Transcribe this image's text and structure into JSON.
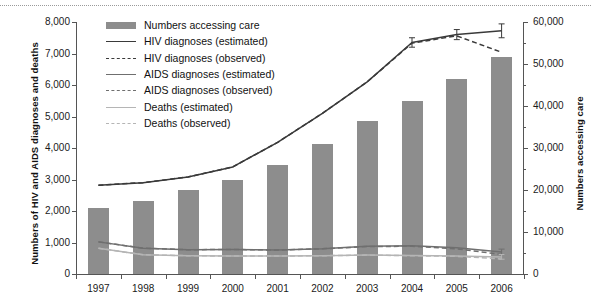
{
  "chart_data": {
    "type": "bar",
    "title": "",
    "subtitle": "",
    "categories": [
      "1997",
      "1998",
      "1999",
      "2000",
      "2001",
      "2002",
      "2003",
      "2004",
      "2005",
      "2006"
    ],
    "xlabel": "",
    "ylabel": "Numbers of HIV and AIDS diagnoses and deaths",
    "y2label": "Numbers accessing care",
    "ylim": [
      0,
      8000
    ],
    "y2lim": [
      0,
      60000
    ],
    "yticks": [
      "0",
      "1,000",
      "2,000",
      "3,000",
      "4,000",
      "5,000",
      "6,000",
      "7,000",
      "8,000"
    ],
    "ytick_values": [
      0,
      1000,
      2000,
      3000,
      4000,
      5000,
      6000,
      7000,
      8000
    ],
    "y2ticks": [
      "0",
      "10,000",
      "20,000",
      "30,000",
      "40,000",
      "50,000",
      "60,000"
    ],
    "y2tick_values": [
      0,
      10000,
      20000,
      30000,
      40000,
      50000,
      60000
    ],
    "grid": false,
    "legend_position": "top-left",
    "series": [
      {
        "name": "Numbers accessing care",
        "kind": "bar",
        "axis": "right",
        "color": "#8d8d8d",
        "values": [
          15700,
          17400,
          19900,
          22300,
          26000,
          31000,
          36400,
          41100,
          46500,
          51600
        ]
      },
      {
        "name": "HIV diagnoses (estimated)",
        "kind": "line",
        "style": "solid",
        "axis": "left",
        "color": "#3a3a3a",
        "values": [
          2820,
          2900,
          3080,
          3400,
          4180,
          5100,
          6100,
          7350,
          7600,
          7720
        ],
        "error_bars": [
          {
            "category": "2004",
            "value": 7350,
            "low": 7200,
            "high": 7500
          },
          {
            "category": "2005",
            "value": 7600,
            "low": 7440,
            "high": 7760
          },
          {
            "category": "2006",
            "value": 7720,
            "low": 7500,
            "high": 7940
          }
        ]
      },
      {
        "name": "HIV diagnoses (observed)",
        "kind": "line",
        "style": "dashed",
        "axis": "left",
        "color": "#3a3a3a",
        "values": [
          2820,
          2900,
          3080,
          3400,
          4180,
          5100,
          6100,
          7330,
          7560,
          7040
        ]
      },
      {
        "name": "AIDS diagnoses (estimated)",
        "kind": "line",
        "style": "solid",
        "axis": "left",
        "color": "#6f6f6f",
        "values": [
          1020,
          820,
          770,
          780,
          760,
          800,
          880,
          900,
          830,
          700
        ],
        "error_bars": [
          {
            "category": "2006",
            "value": 700,
            "low": 620,
            "high": 790
          }
        ]
      },
      {
        "name": "AIDS diagnoses (observed)",
        "kind": "line",
        "style": "dashed",
        "axis": "left",
        "color": "#6f6f6f",
        "values": [
          1020,
          820,
          770,
          780,
          760,
          800,
          870,
          880,
          800,
          620
        ]
      },
      {
        "name": "Deaths (estimated)",
        "kind": "line",
        "style": "solid",
        "axis": "left",
        "color": "#b5b5b5",
        "values": [
          820,
          610,
          580,
          570,
          570,
          580,
          600,
          590,
          570,
          540
        ],
        "error_bars": [
          {
            "category": "2006",
            "value": 540,
            "low": 470,
            "high": 620
          }
        ]
      },
      {
        "name": "Deaths (observed)",
        "kind": "line",
        "style": "dashed",
        "axis": "left",
        "color": "#b5b5b5",
        "values": [
          820,
          610,
          580,
          570,
          570,
          580,
          600,
          580,
          560,
          480
        ]
      }
    ]
  },
  "legend": {
    "items": [
      {
        "label": "Numbers accessing care",
        "key": "swatch",
        "color": "#8d8d8d"
      },
      {
        "label": "HIV diagnoses (estimated)",
        "key": "line-solid",
        "color": "#3a3a3a"
      },
      {
        "label": "HIV diagnoses (observed)",
        "key": "line-dashed",
        "color": "#3a3a3a"
      },
      {
        "label": "AIDS diagnoses (estimated)",
        "key": "line-solid",
        "color": "#6f6f6f"
      },
      {
        "label": "AIDS diagnoses (observed)",
        "key": "line-dashed",
        "color": "#6f6f6f"
      },
      {
        "label": "Deaths (estimated)",
        "key": "line-solid",
        "color": "#b5b5b5"
      },
      {
        "label": "Deaths (observed)",
        "key": "line-dashed",
        "color": "#b5b5b5"
      }
    ]
  }
}
